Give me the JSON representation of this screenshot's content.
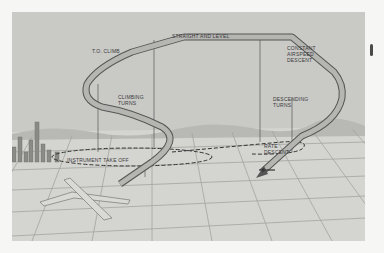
{
  "diagram": {
    "labels": {
      "td_climb": "T.O. CLIMB",
      "straight_level": "STRAIGHT AND LEVEL",
      "constant_airspeed": "CONSTANT\nAIRSPEED\nDESCENT",
      "climbing_turns": "CLIMBING\nTURNS",
      "descending_turns": "DESCENDING\nTURNS",
      "rate_descent": "RATE\nDESCENT",
      "instrument_takeoff": "INSTRUMENT TAKE OFF"
    },
    "colors": {
      "background": "#c9c9c6",
      "ground_grid": "#a3a3a0",
      "ribbon_fill": "#b5b5b2",
      "ribbon_edge": "#555555",
      "text": "#3a3a3a"
    }
  }
}
